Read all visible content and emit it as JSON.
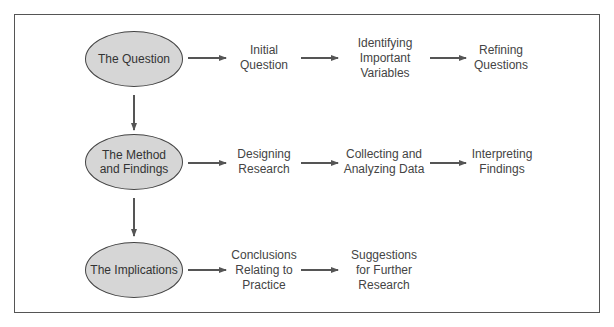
{
  "rows": [
    {
      "stage": "The Question",
      "steps": [
        "Initial\nQuestion",
        "Identifying\nImportant\nVariables",
        "Refining\nQuestions"
      ]
    },
    {
      "stage": "The Method\nand Findings",
      "steps": [
        "Designing\nResearch",
        "Collecting and\nAnalyzing Data",
        "Interpreting\nFindings"
      ]
    },
    {
      "stage": "The Implications",
      "steps": [
        "Conclusions\nRelating to\nPractice",
        "Suggestions\nfor Further\nResearch"
      ]
    }
  ],
  "colors": {
    "ellipse_fill": "#d6d6d6",
    "stroke": "#555555",
    "text": "#444444"
  }
}
